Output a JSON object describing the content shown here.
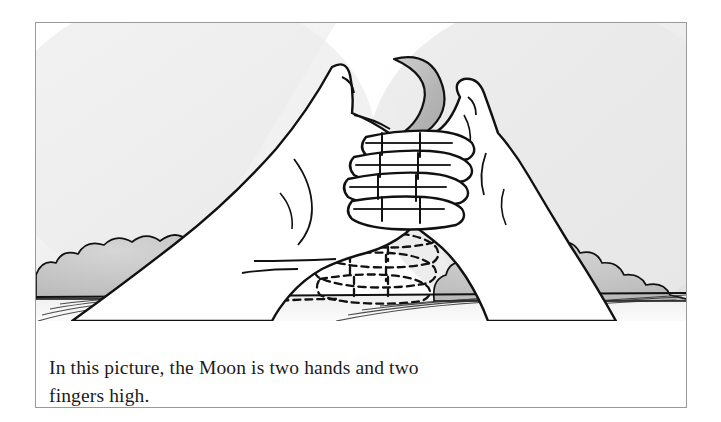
{
  "figure": {
    "caption_lines": [
      "In this picture, the Moon is two hands and two",
      "fingers high."
    ],
    "border_color": "#9a9a9a",
    "page_background": "#ffffff"
  },
  "illustration": {
    "title": "measuring-moon-altitude-with-hands",
    "ink_color": "#111111",
    "sky": {
      "label": "sky",
      "color_light": "#ffffff",
      "color_shade": "#e3e3e3"
    },
    "moon": {
      "label": "crescent-moon",
      "fill": "#b9b9b9",
      "outline": "#111111",
      "phase": "waning-crescent"
    },
    "ground": {
      "label": "ground-horizon",
      "hatch_color": "#333333",
      "horizon_y": 272
    },
    "bushes": [
      {
        "label": "bush-cluster-left",
        "fill": "#bdbdbd"
      },
      {
        "label": "bush-cluster-right",
        "fill": "#bdbdbd"
      }
    ],
    "hands": [
      {
        "label": "left-hand-solid",
        "style": "solid",
        "fill": "#ffffff"
      },
      {
        "label": "right-hand-solid",
        "style": "solid",
        "fill": "#ffffff"
      },
      {
        "label": "ghost-hand-dashed",
        "style": "dashed",
        "fill": "none"
      }
    ],
    "measure_note": "two hands and two fingers"
  }
}
